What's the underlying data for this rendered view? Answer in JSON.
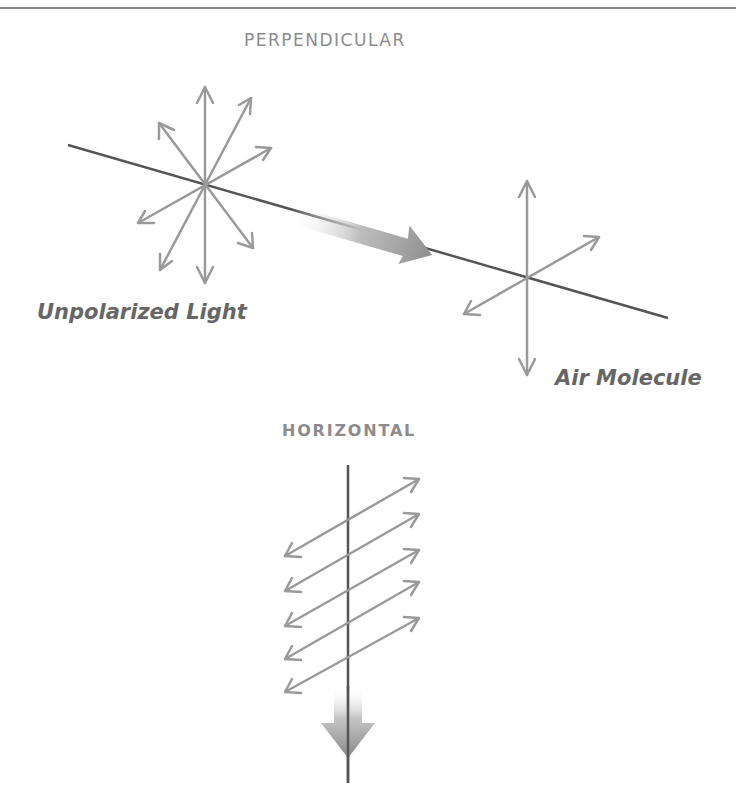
{
  "sections": {
    "perpendicular": {
      "heading": "PERPENDICULAR",
      "labels": {
        "source": "Unpolarized Light",
        "scatterer": "Air Molecule"
      }
    },
    "horizontal": {
      "heading": "HORIZONTAL"
    }
  },
  "colors": {
    "arrow": "#9a9a9a",
    "line": "#555555",
    "heading": "#8c8c8c",
    "label": "#666666",
    "border": "#8a8a8a"
  }
}
